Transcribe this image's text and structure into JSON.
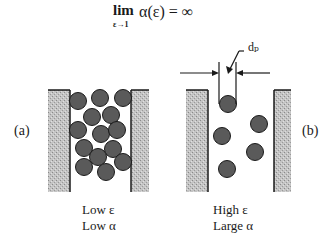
{
  "formula": {
    "operator": "lim",
    "subscript": "ε→1",
    "expression": "α(ε) = ∞"
  },
  "panel_a": {
    "label": "(a)",
    "caption_line1": "Low ε",
    "caption_line2": "Low α",
    "particle_count": 14
  },
  "panel_b": {
    "label": "(b)",
    "caption_line1": "High ε",
    "caption_line2": "Large α",
    "particle_count": 5,
    "dimension_label": "dₚ"
  },
  "colors": {
    "wall": "#b8b8b8",
    "particle": "#5a5a5a",
    "outline": "#1a1a1a"
  }
}
